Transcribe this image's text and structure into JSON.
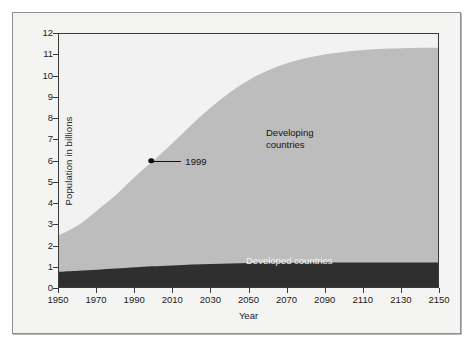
{
  "chart_data": {
    "type": "area",
    "title": "",
    "subtitle": "",
    "xlabel": "Year",
    "ylabel": "Population in billions",
    "xlim": [
      1950,
      2150
    ],
    "ylim": [
      0,
      12
    ],
    "grid": false,
    "legend_position": "inline-labels",
    "x_ticks": [
      1950,
      1970,
      1990,
      2010,
      2030,
      2050,
      2070,
      2090,
      2110,
      2130,
      2150
    ],
    "x_tick_labels": [
      "1950",
      "1970",
      "1990",
      "2010",
      "2030",
      "2050",
      "2070",
      "2090",
      "2110",
      "2130",
      "2150"
    ],
    "y_ticks": [
      0,
      1,
      2,
      3,
      4,
      5,
      6,
      7,
      8,
      9,
      10,
      11,
      12
    ],
    "y_tick_labels": [
      "0",
      "1",
      "2",
      "3",
      "4",
      "5",
      "6",
      "7",
      "8",
      "9",
      "10",
      "11",
      "12"
    ],
    "stacked": true,
    "x": [
      1950,
      1960,
      1970,
      1980,
      1990,
      1999,
      2000,
      2010,
      2020,
      2030,
      2040,
      2050,
      2060,
      2070,
      2080,
      2090,
      2100,
      2110,
      2120,
      2130,
      2140,
      2150
    ],
    "series": [
      {
        "name": "Developed countries",
        "color": "#2f2f2f",
        "label_color": "#f0f0f0",
        "values": [
          0.81,
          0.86,
          0.91,
          0.96,
          1.02,
          1.07,
          1.07,
          1.11,
          1.15,
          1.18,
          1.2,
          1.22,
          1.23,
          1.24,
          1.24,
          1.25,
          1.25,
          1.25,
          1.25,
          1.25,
          1.25,
          1.25
        ]
      },
      {
        "name": "Developing countries",
        "color": "#bdbdbd",
        "label_color": "#141414",
        "values": [
          1.72,
          2.14,
          2.79,
          3.47,
          4.27,
          4.93,
          4.99,
          5.79,
          6.62,
          7.39,
          8.07,
          8.63,
          9.06,
          9.39,
          9.63,
          9.8,
          9.92,
          10.0,
          10.05,
          10.08,
          10.1,
          10.1
        ]
      }
    ],
    "total_values": [
      2.53,
      3.0,
      3.7,
      4.43,
      5.29,
      6.0,
      6.06,
      6.9,
      7.77,
      8.57,
      9.27,
      9.85,
      10.29,
      10.63,
      10.87,
      11.05,
      11.17,
      11.25,
      11.3,
      11.33,
      11.35,
      11.35
    ],
    "annotations": [
      {
        "label": "1999",
        "x": 1999,
        "y": 6,
        "marker": "dot",
        "leader": "horizontal-right"
      }
    ],
    "colors": {
      "developed": "#2f2f2f",
      "developing": "#bdbdbd",
      "plot_background": "#f2f2f2",
      "figure_background": "#f4f4f2",
      "axis": "#3a3a3a",
      "text": "#1b1b1b"
    }
  },
  "axis": {
    "y_title": "Population in billions",
    "x_title": "Year"
  },
  "labels": {
    "developing": "Developing\ncountries",
    "developed": "Developed countries",
    "annotation_1999": "1999"
  }
}
